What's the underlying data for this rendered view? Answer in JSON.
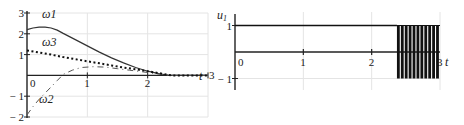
{
  "chart_data": [
    {
      "type": "line",
      "title": "",
      "xlabel": "t",
      "ylabel": "",
      "xlim": [
        0,
        3
      ],
      "ylim": [
        -2,
        3
      ],
      "x_ticks": [
        "0",
        "1",
        "2",
        "3"
      ],
      "y_ticks": [
        "3",
        "2",
        "1",
        "-1",
        "-2"
      ],
      "grid": true,
      "series": [
        {
          "name": "ω1",
          "style": "solid",
          "points": [
            [
              0,
              2.2
            ],
            [
              0.1,
              2.28
            ],
            [
              0.2,
              2.32
            ],
            [
              0.3,
              2.32
            ],
            [
              0.4,
              2.28
            ],
            [
              0.5,
              2.18
            ],
            [
              0.6,
              2.02
            ],
            [
              0.8,
              1.72
            ],
            [
              1.0,
              1.42
            ],
            [
              1.2,
              1.12
            ],
            [
              1.4,
              0.84
            ],
            [
              1.6,
              0.6
            ],
            [
              1.8,
              0.38
            ],
            [
              2.0,
              0.2
            ],
            [
              2.2,
              0.07
            ],
            [
              2.35,
              0.0
            ],
            [
              3.0,
              0.0
            ]
          ]
        },
        {
          "name": "ω2",
          "style": "dash-dot",
          "points": [
            [
              0,
              -1.9
            ],
            [
              0.1,
              -1.5
            ],
            [
              0.2,
              -1.15
            ],
            [
              0.35,
              -0.7
            ],
            [
              0.5,
              -0.25
            ],
            [
              0.6,
              0.05
            ],
            [
              0.75,
              0.25
            ],
            [
              0.9,
              0.38
            ],
            [
              1.1,
              0.42
            ],
            [
              1.3,
              0.4
            ],
            [
              1.5,
              0.32
            ],
            [
              1.7,
              0.25
            ],
            [
              1.9,
              0.18
            ],
            [
              2.1,
              0.1
            ],
            [
              2.3,
              0.02
            ],
            [
              2.4,
              0.0
            ],
            [
              3.0,
              0.0
            ]
          ]
        },
        {
          "name": "ω3",
          "style": "dotted",
          "points": [
            [
              0,
              1.2
            ],
            [
              0.2,
              1.1
            ],
            [
              0.4,
              1.0
            ],
            [
              0.6,
              0.88
            ],
            [
              0.8,
              0.78
            ],
            [
              1.0,
              0.68
            ],
            [
              1.2,
              0.58
            ],
            [
              1.4,
              0.48
            ],
            [
              1.6,
              0.38
            ],
            [
              1.8,
              0.3
            ],
            [
              2.0,
              0.2
            ],
            [
              2.2,
              0.1
            ],
            [
              2.4,
              0.0
            ],
            [
              3.0,
              0.0
            ]
          ]
        }
      ],
      "annotations": [
        {
          "text": "ω1",
          "x": 0.25,
          "y": 2.75
        },
        {
          "text": "ω3",
          "x": 0.25,
          "y": 1.4
        },
        {
          "text": "ω2",
          "x": 0.2,
          "y": -1.35
        }
      ]
    },
    {
      "type": "line",
      "title": "",
      "xlabel": "t",
      "ylabel": "u1",
      "xlim": [
        0,
        3
      ],
      "ylim": [
        -1.4,
        1.4
      ],
      "x_ticks": [
        "0",
        "1",
        "2",
        "3"
      ],
      "y_ticks": [
        "1",
        "-1"
      ],
      "grid": true,
      "series": [
        {
          "name": "u1",
          "style": "solid",
          "description": "constant 1 until switching, then bang-bang chattering between -1 and 1",
          "constant_value": 1,
          "constant_until": 2.37,
          "chatter_range": [
            2.37,
            3.0
          ],
          "chatter_values": [
            -1,
            1
          ],
          "chatter_pulses": 11
        }
      ],
      "annotations": []
    }
  ]
}
